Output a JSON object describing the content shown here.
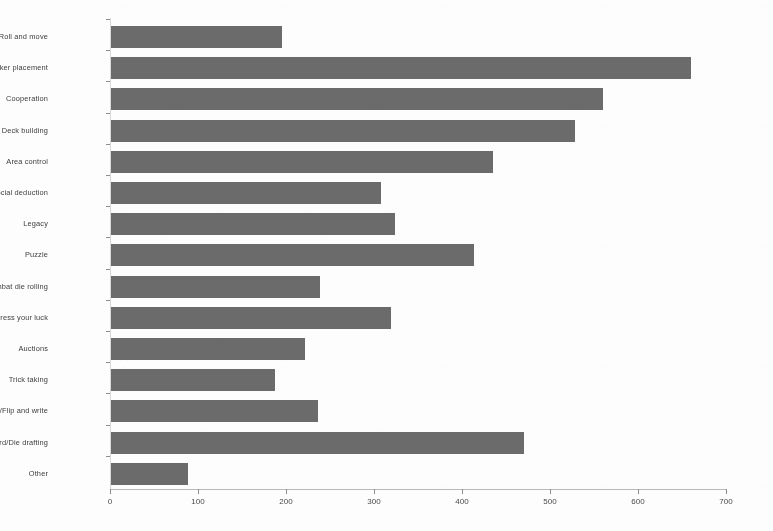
{
  "chart_data": {
    "type": "bar",
    "orientation": "horizontal",
    "title": "",
    "subtitle": "",
    "xlabel": "",
    "ylabel": "",
    "xlim": [
      0,
      700
    ],
    "xticks": [
      0,
      100,
      200,
      300,
      400,
      500,
      600,
      700
    ],
    "xtick_labels": [
      "0",
      "100",
      "200",
      "300",
      "400",
      "500",
      "600",
      "700"
    ],
    "grid": false,
    "legend": null,
    "bar_color": "#6b6b6b",
    "background_color": "#fdfdfd",
    "categories": [
      "Roll and move",
      "Worker placement",
      "Cooperation",
      "Deck building",
      "Area control",
      "Secret identity/Social deduction",
      "Legacy",
      "Puzzle",
      "Combat die rolling",
      "Press your luck",
      "Auctions",
      "Trick taking",
      "Roll/Flip and write",
      "Card/Die drafting",
      "Other"
    ],
    "values": [
      195,
      660,
      560,
      528,
      435,
      308,
      324,
      414,
      239,
      319,
      222,
      188,
      236,
      470,
      89
    ],
    "series": [
      {
        "name": "Count",
        "values": [
          195,
          660,
          560,
          528,
          435,
          308,
          324,
          414,
          239,
          319,
          222,
          188,
          236,
          470,
          89
        ]
      }
    ]
  }
}
